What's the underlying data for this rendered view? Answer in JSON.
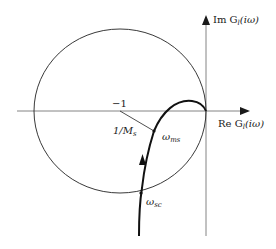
{
  "diagram": {
    "type": "nyquist-plot",
    "axes": {
      "real_label": "Re G",
      "real_sub": "l",
      "real_arg": "(iω)",
      "imag_label": "Im G",
      "imag_sub": "l",
      "imag_arg": "(iω)"
    },
    "annotations": {
      "critical_point": "−1",
      "radius_label": "1/M",
      "radius_sub": "s",
      "omega_ms": "ω",
      "omega_ms_sub": "ms",
      "omega_sc": "ω",
      "omega_sc_sub": "sc"
    },
    "colors": {
      "stroke": "#1a1a1a",
      "axis": "#555555",
      "background": "#ffffff"
    }
  }
}
